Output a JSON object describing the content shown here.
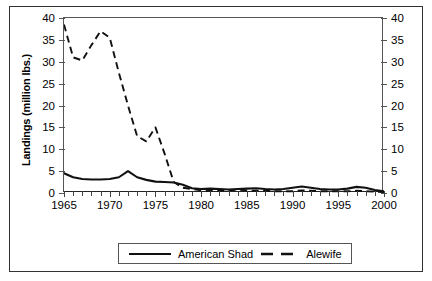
{
  "chart_data": {
    "type": "line",
    "title": "",
    "xlabel": "",
    "ylabel": "Landings (million lbs.)",
    "xlim": [
      1965,
      2000
    ],
    "ylim": [
      0,
      40
    ],
    "ytick_step": 5,
    "xtick_step": 1,
    "xlabel_step": 5,
    "grid": false,
    "dual_axis": true,
    "right_axis_label": "",
    "legend_position": "bottom-center",
    "y_ticks": [
      0,
      5,
      10,
      15,
      20,
      25,
      30,
      35,
      40
    ],
    "y_tick_labels": [
      "0",
      "5",
      "10",
      "15",
      "20",
      "25",
      "30",
      "35",
      "40"
    ],
    "y_ticks_right": [
      0,
      5,
      10,
      15,
      20,
      25,
      30,
      35,
      40
    ],
    "y_tick_labels_right": [
      "0",
      "5",
      "10",
      "15",
      "20",
      "25",
      "30",
      "35",
      "40"
    ],
    "x": [
      1965,
      1966,
      1967,
      1968,
      1969,
      1970,
      1971,
      1972,
      1973,
      1974,
      1975,
      1976,
      1977,
      1978,
      1979,
      1980,
      1981,
      1982,
      1983,
      1984,
      1985,
      1986,
      1987,
      1988,
      1989,
      1990,
      1991,
      1992,
      1993,
      1994,
      1995,
      1996,
      1997,
      1998,
      1999,
      2000
    ],
    "x_tick_labels": [
      "1965",
      "1970",
      "1975",
      "1980",
      "1985",
      "1990",
      "1995",
      "2000"
    ],
    "x_labeled_values": [
      1965,
      1970,
      1975,
      1980,
      1985,
      1990,
      1995,
      2000
    ],
    "series": [
      {
        "name": "American Shad",
        "style": "solid",
        "color": "#111111",
        "values": [
          4.5,
          3.6,
          3.2,
          3.1,
          3.1,
          3.2,
          3.6,
          5.0,
          3.6,
          3.0,
          2.6,
          2.5,
          2.4,
          1.9,
          1.1,
          0.9,
          1.0,
          0.9,
          0.8,
          0.9,
          1.0,
          1.1,
          0.9,
          0.8,
          0.9,
          1.2,
          1.5,
          1.2,
          0.9,
          0.8,
          0.8,
          1.0,
          1.4,
          1.2,
          0.7,
          0.4
        ]
      },
      {
        "name": "Alewife",
        "style": "dashed",
        "color": "#111111",
        "values": [
          38.5,
          31.0,
          30.3,
          33.8,
          37.0,
          35.5,
          27.5,
          20.0,
          13.0,
          11.8,
          15.0,
          9.0,
          2.5,
          1.2,
          0.9,
          0.6,
          0.5,
          0.5,
          0.6,
          0.8,
          0.6,
          0.5,
          0.5,
          0.4,
          0.4,
          0.4,
          0.6,
          0.5,
          0.4,
          0.4,
          0.4,
          0.4,
          0.5,
          0.4,
          0.3,
          0.2
        ]
      }
    ]
  },
  "legend": {
    "items": [
      {
        "label": "American Shad",
        "style": "solid"
      },
      {
        "label": "Alewife",
        "style": "dashed"
      }
    ]
  }
}
